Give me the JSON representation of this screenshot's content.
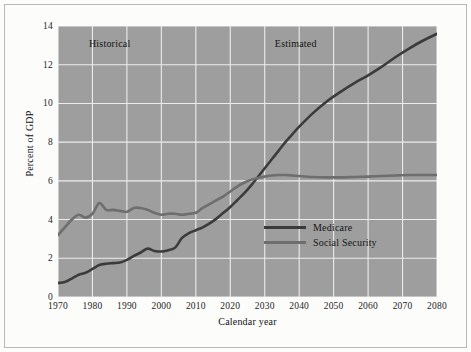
{
  "chart_data": {
    "type": "line",
    "title": "",
    "xlabel": "Calendar year",
    "ylabel": "Percent of GDP",
    "xlim": [
      1970,
      2080
    ],
    "ylim": [
      0,
      14
    ],
    "xticks": [
      1970,
      1980,
      1990,
      2000,
      2010,
      2020,
      2030,
      2040,
      2050,
      2060,
      2070,
      2080
    ],
    "yticks": [
      0,
      2,
      4,
      6,
      8,
      10,
      12,
      14
    ],
    "grid": true,
    "legend_position": "inside-lower-right",
    "plot_background": "#9e9e9e",
    "grid_color": "#ececec",
    "annotations": [
      {
        "text": "Historical",
        "x": 1985,
        "y": 13.1
      },
      {
        "text": "Estimated",
        "x": 2039,
        "y": 13.1
      }
    ],
    "series": [
      {
        "name": "Medicare",
        "color": "#3b3b3b",
        "x": [
          1970,
          1972,
          1974,
          1976,
          1978,
          1980,
          1982,
          1984,
          1986,
          1988,
          1990,
          1992,
          1994,
          1996,
          1998,
          2000,
          2002,
          2004,
          2006,
          2008,
          2010,
          2012,
          2014,
          2016,
          2018,
          2020,
          2022,
          2024,
          2026,
          2028,
          2030,
          2032,
          2034,
          2036,
          2038,
          2040,
          2044,
          2048,
          2052,
          2056,
          2060,
          2064,
          2068,
          2072,
          2076,
          2080
        ],
        "values": [
          0.72,
          0.78,
          0.95,
          1.15,
          1.25,
          1.45,
          1.65,
          1.72,
          1.75,
          1.78,
          1.92,
          2.12,
          2.3,
          2.5,
          2.38,
          2.35,
          2.42,
          2.55,
          3.05,
          3.3,
          3.45,
          3.6,
          3.8,
          4.05,
          4.35,
          4.65,
          5.0,
          5.35,
          5.75,
          6.2,
          6.65,
          7.1,
          7.55,
          8.0,
          8.4,
          8.8,
          9.5,
          10.1,
          10.6,
          11.05,
          11.45,
          11.9,
          12.4,
          12.85,
          13.25,
          13.6
        ]
      },
      {
        "name": "Social Security",
        "color": "#6e6e6e",
        "x": [
          1970,
          1972,
          1974,
          1976,
          1978,
          1980,
          1982,
          1984,
          1986,
          1988,
          1990,
          1992,
          1994,
          1996,
          1998,
          2000,
          2002,
          2004,
          2006,
          2008,
          2010,
          2012,
          2014,
          2016,
          2018,
          2020,
          2022,
          2024,
          2026,
          2028,
          2030,
          2032,
          2034,
          2036,
          2038,
          2040,
          2044,
          2048,
          2052,
          2056,
          2060,
          2064,
          2068,
          2072,
          2076,
          2080
        ],
        "values": [
          3.2,
          3.6,
          4.0,
          4.25,
          4.1,
          4.3,
          4.85,
          4.5,
          4.5,
          4.45,
          4.4,
          4.6,
          4.6,
          4.5,
          4.35,
          4.25,
          4.3,
          4.3,
          4.25,
          4.3,
          4.35,
          4.6,
          4.8,
          5.0,
          5.2,
          5.45,
          5.7,
          5.9,
          6.05,
          6.15,
          6.22,
          6.28,
          6.3,
          6.3,
          6.28,
          6.25,
          6.2,
          6.18,
          6.18,
          6.2,
          6.22,
          6.25,
          6.28,
          6.3,
          6.3,
          6.3
        ]
      }
    ]
  },
  "legend": {
    "items": [
      {
        "label": "Medicare",
        "color": "#3b3b3b"
      },
      {
        "label": "Social Security",
        "color": "#6e6e6e"
      }
    ]
  }
}
